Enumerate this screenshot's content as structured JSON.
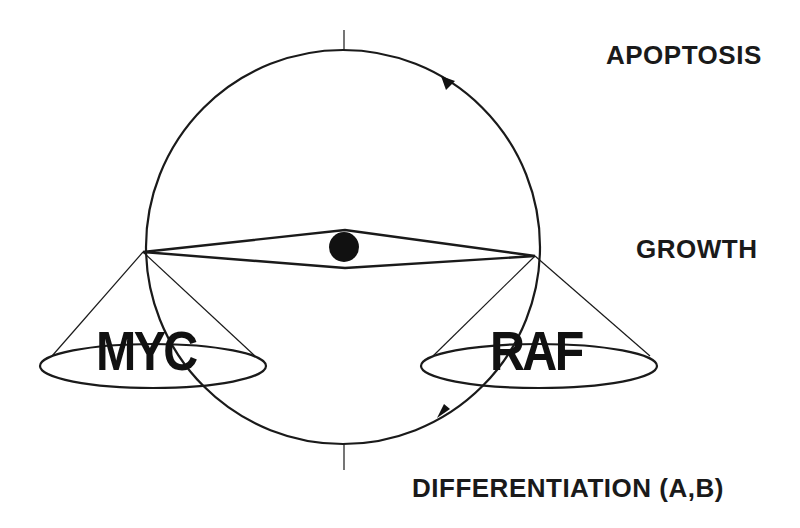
{
  "diagram": {
    "type": "balance-scale-cycle",
    "labels": {
      "top": "APOPTOSIS",
      "middle": "GROWTH",
      "bottom": "DIFFERENTIATION (A,B)"
    },
    "pans": {
      "left": "MYC",
      "right": "RAF"
    },
    "cycle_direction": "counterclockwise",
    "colors": {
      "ink": "#1a1a1a",
      "background": "#ffffff"
    }
  }
}
